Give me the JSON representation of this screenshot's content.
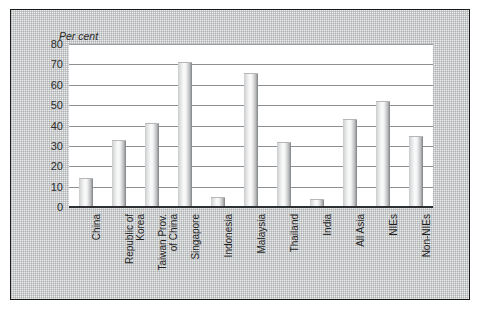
{
  "chart_data": {
    "type": "bar",
    "title": "",
    "subtitle": "",
    "xlabel": "",
    "ylabel": "Per cent",
    "ylim": [
      0,
      80
    ],
    "ytick_step": 10,
    "yticks": [
      80,
      70,
      60,
      50,
      40,
      30,
      20,
      10,
      0
    ],
    "grid": true,
    "legend": false,
    "categories": [
      "China",
      "Republic of\nKorea",
      "Taiwan Prov.\nof China",
      "Singapore",
      "Indonesia",
      "Malaysia",
      "Thailand",
      "India",
      "All Asia",
      "NIEs",
      "Non-NIEs"
    ],
    "values": [
      14,
      33,
      41,
      71,
      5,
      66,
      32,
      4,
      43,
      52,
      35
    ],
    "bar_color": "#dcdddd"
  },
  "frame": {
    "border_color": "#1a1a1a",
    "background_color": "#eceded",
    "plot_background_color": "#ffffff"
  }
}
